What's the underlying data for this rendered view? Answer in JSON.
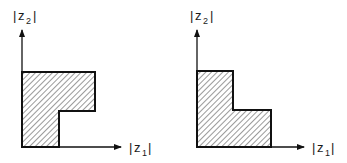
{
  "figure": {
    "panels": [
      {
        "id": "left",
        "y_axis_label": {
          "base": "z",
          "subscript": "2"
        },
        "x_axis_label": {
          "base": "z",
          "subscript": "1"
        },
        "region_shape": "L-shape with top arm extending right (notch at lower-right)",
        "fill": "diagonal hatching"
      },
      {
        "id": "right",
        "y_axis_label": {
          "base": "z",
          "subscript": "2"
        },
        "x_axis_label": {
          "base": "z",
          "subscript": "1"
        },
        "region_shape": "L-shape with bottom arm extending right (step at upper-right)",
        "fill": "diagonal hatching"
      }
    ],
    "colors": {
      "line": "#111111",
      "hatch": "#555555",
      "background": "#ffffff"
    }
  }
}
